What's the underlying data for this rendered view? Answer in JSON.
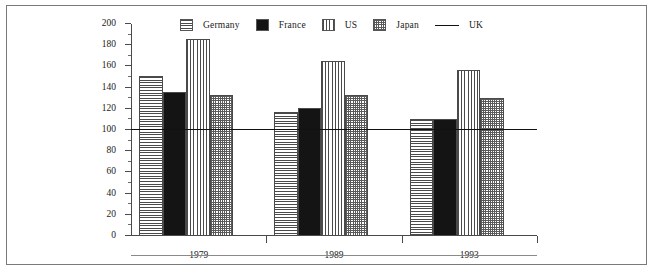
{
  "chart_data": {
    "type": "bar",
    "title": "",
    "subtitle": "",
    "xlabel": "",
    "ylabel": "",
    "categories": [
      "1979",
      "1989",
      "1993"
    ],
    "series": [
      {
        "name": "Germany",
        "pattern": "horizontal-lines",
        "values": [
          151,
          117,
          110
        ]
      },
      {
        "name": "France",
        "pattern": "solid-black",
        "values": [
          136,
          121,
          110
        ]
      },
      {
        "name": "US",
        "pattern": "vertical-lines",
        "values": [
          186,
          165,
          157
        ]
      },
      {
        "name": "Japan",
        "pattern": "crosshatch",
        "values": [
          133,
          133,
          130
        ]
      }
    ],
    "reference_lines": [
      {
        "name": "UK",
        "value": 100,
        "style": "solid",
        "color": "#111111"
      }
    ],
    "ylim": [
      0,
      200
    ],
    "ytick_step": 20,
    "yminor_step": 10,
    "ytick_labels": [
      "0",
      "20",
      "40",
      "60",
      "80",
      "100",
      "120",
      "140",
      "160",
      "180",
      "200"
    ],
    "grid": false,
    "legend_position": "top"
  },
  "legend": {
    "entries": [
      {
        "label": "Germany",
        "type": "swatch",
        "pattern": "horizontal-lines"
      },
      {
        "label": "France",
        "type": "swatch",
        "pattern": "solid-black"
      },
      {
        "label": "US",
        "type": "swatch",
        "pattern": "vertical-lines"
      },
      {
        "label": "Japan",
        "type": "swatch",
        "pattern": "crosshatch"
      },
      {
        "label": "UK",
        "type": "line",
        "color": "#111111"
      }
    ]
  },
  "colors": {
    "ink": "#1a1a1a",
    "axis": "#4a4a4a",
    "frame": "#7a7a7a",
    "solid_fill": "#141414",
    "reference_line": "#111111"
  }
}
